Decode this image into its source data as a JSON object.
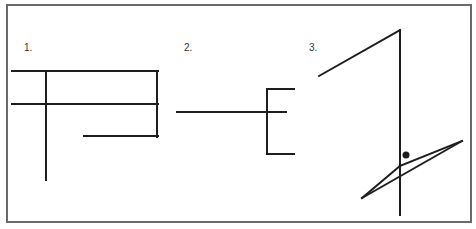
{
  "colors": {
    "background": "#ffffff",
    "frame": "#6a6a6a",
    "stroke": "#1e1e1e",
    "label": "#333333"
  },
  "frame": {
    "x": 7,
    "y": 5,
    "width": 464,
    "height": 217,
    "stroke_width": 2
  },
  "figures": [
    {
      "label": "1.",
      "label_pos": {
        "x": 24,
        "y": 43
      },
      "segments": [
        {
          "name": "top-horizontal",
          "x1": 12,
          "y1": 71,
          "x2": 158,
          "y2": 71
        },
        {
          "name": "middle-horizontal",
          "x1": 12,
          "y1": 104,
          "x2": 158,
          "y2": 104
        },
        {
          "name": "right-vertical",
          "x1": 157,
          "y1": 71,
          "x2": 157,
          "y2": 137
        },
        {
          "name": "bottom-horizontal",
          "x1": 84,
          "y1": 136,
          "x2": 158,
          "y2": 136
        },
        {
          "name": "long-vertical",
          "x1": 46,
          "y1": 71,
          "x2": 46,
          "y2": 180
        }
      ]
    },
    {
      "label": "2.",
      "label_pos": {
        "x": 184,
        "y": 43
      },
      "segments": [
        {
          "name": "long-horizontal",
          "x1": 177,
          "y1": 112,
          "x2": 286,
          "y2": 112
        },
        {
          "name": "bracket-vertical",
          "x1": 267,
          "y1": 89,
          "x2": 267,
          "y2": 154
        },
        {
          "name": "bracket-top-arm",
          "x1": 267,
          "y1": 89,
          "x2": 294,
          "y2": 89
        },
        {
          "name": "bracket-bottom-arm",
          "x1": 267,
          "y1": 154,
          "x2": 294,
          "y2": 154
        }
      ]
    },
    {
      "label": "3.",
      "label_pos": {
        "x": 309,
        "y": 43
      },
      "segments": [
        {
          "name": "rising-diagonal",
          "x1": 319,
          "y1": 76,
          "x2": 400,
          "y2": 30
        },
        {
          "name": "long-vertical",
          "x1": 400,
          "y1": 30,
          "x2": 400,
          "y2": 215
        },
        {
          "name": "slant-upper-left",
          "x1": 362,
          "y1": 198,
          "x2": 400,
          "y2": 166
        },
        {
          "name": "slant-upper-right",
          "x1": 400,
          "y1": 166,
          "x2": 462,
          "y2": 141
        },
        {
          "name": "slant-lower",
          "x1": 362,
          "y1": 198,
          "x2": 462,
          "y2": 141
        }
      ],
      "dot": {
        "cx": 406,
        "cy": 155,
        "r": 3.5
      }
    }
  ]
}
